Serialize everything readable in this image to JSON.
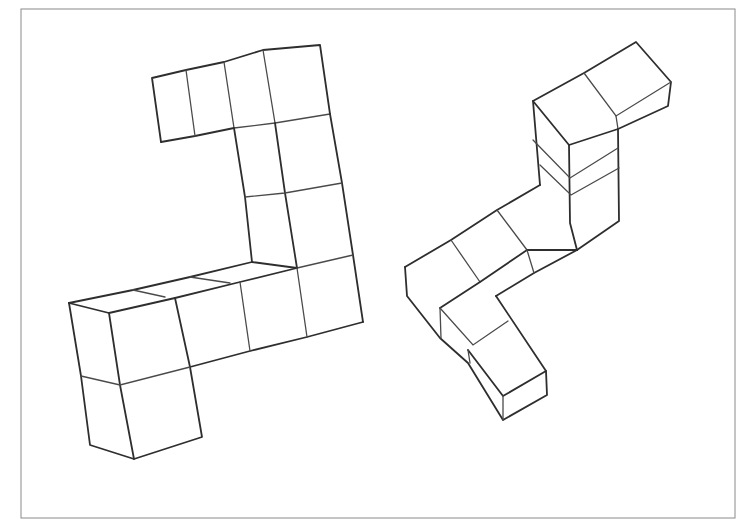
{
  "figure": {
    "frame": {
      "left": 21,
      "top": 9,
      "right": 735,
      "bottom": 518,
      "color": "#8a8a8a"
    },
    "stroke_color": "#2e2e2e",
    "background": "#ffffff",
    "objects": [
      {
        "name": "left-cube-structure",
        "cube_count": 13,
        "position": "left"
      },
      {
        "name": "right-cube-structure",
        "cube_count": 11,
        "position": "right"
      }
    ]
  }
}
